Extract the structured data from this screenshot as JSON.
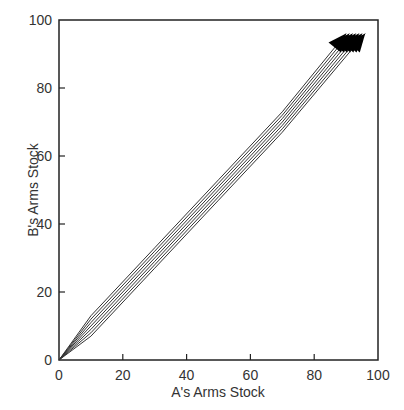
{
  "chart_data": {
    "type": "line",
    "title": "",
    "xlabel": "A's Arms Stock",
    "ylabel": "B's Arms Stock",
    "xlim": [
      0,
      100
    ],
    "ylim": [
      0,
      100
    ],
    "xticks": [
      0,
      20,
      40,
      60,
      80,
      100
    ],
    "yticks": [
      0,
      20,
      40,
      60,
      80,
      100
    ],
    "grid": false,
    "legend": null,
    "annotations": "Trajectories start near origin and run parallel along the diagonal, ending in arrowheads near (95, 97)",
    "series": [
      {
        "name": "trajectory-1",
        "x": [
          0,
          10,
          30,
          50,
          70,
          90
        ],
        "y": [
          0,
          13,
          33,
          53,
          73,
          96
        ]
      },
      {
        "name": "trajectory-2",
        "x": [
          0,
          10,
          30,
          50,
          70,
          91
        ],
        "y": [
          0,
          12,
          32,
          52,
          72,
          96
        ]
      },
      {
        "name": "trajectory-3",
        "x": [
          0,
          10,
          30,
          50,
          70,
          92
        ],
        "y": [
          0,
          11,
          31,
          51,
          71,
          96
        ]
      },
      {
        "name": "trajectory-4",
        "x": [
          0,
          10,
          30,
          50,
          70,
          93
        ],
        "y": [
          0,
          10,
          30,
          50,
          70,
          96
        ]
      },
      {
        "name": "trajectory-5",
        "x": [
          0,
          10,
          30,
          50,
          70,
          94
        ],
        "y": [
          0,
          9,
          29,
          49,
          69,
          96
        ]
      },
      {
        "name": "trajectory-6",
        "x": [
          0,
          10,
          30,
          50,
          70,
          95
        ],
        "y": [
          0,
          8,
          28,
          48,
          68,
          96
        ]
      },
      {
        "name": "trajectory-7",
        "x": [
          0,
          10,
          30,
          50,
          70,
          96
        ],
        "y": [
          0,
          7,
          27,
          47,
          67,
          96
        ]
      }
    ],
    "colors": {
      "line": "#333333",
      "arrow": "#000000",
      "frame": "#222222"
    }
  }
}
